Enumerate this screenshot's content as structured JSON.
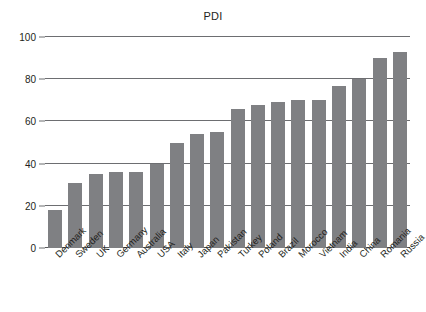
{
  "chart_data": {
    "type": "bar",
    "title": "PDI",
    "xlabel": "",
    "ylabel": "",
    "ylim": [
      0,
      100
    ],
    "yticks": [
      0,
      20,
      40,
      60,
      80,
      100
    ],
    "grid": true,
    "legend": false,
    "orientation": "vertical",
    "bar_color": "#7f8083",
    "categories": [
      "Denmark",
      "Sweden",
      "UK",
      "Germany",
      "Australia",
      "USA",
      "Italy",
      "Japan",
      "Pakistan",
      "Turkey",
      "Poland",
      "Brazil",
      "Morocco",
      "Vietnam",
      "India",
      "China",
      "Romania",
      "Russia"
    ],
    "values": [
      18,
      31,
      35,
      36,
      36,
      40,
      50,
      54,
      55,
      66,
      68,
      69,
      70,
      70,
      77,
      80,
      90,
      93
    ]
  }
}
